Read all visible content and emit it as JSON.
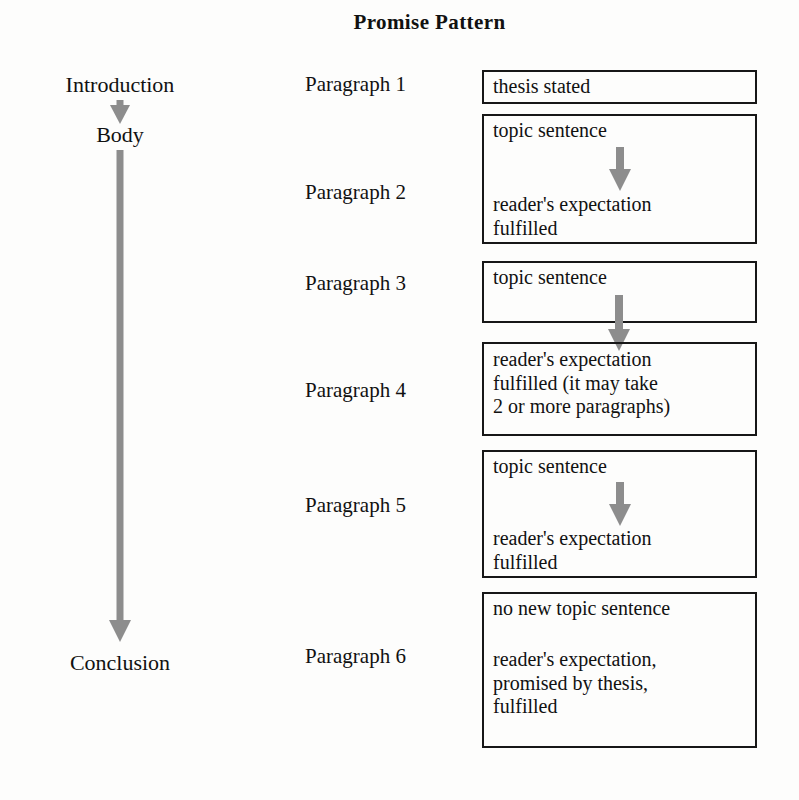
{
  "title": "Promise Pattern",
  "stages": [
    {
      "name": "introduction",
      "label": "Introduction"
    },
    {
      "name": "body",
      "label": "Body"
    },
    {
      "name": "conclusion",
      "label": "Conclusion"
    }
  ],
  "paragraph_labels": [
    "Paragraph 1",
    "Paragraph 2",
    "Paragraph 3",
    "Paragraph 4",
    "Paragraph 5",
    "Paragraph 6"
  ],
  "boxes": [
    {
      "id": "box-1",
      "lines_top": "thesis stated",
      "lines_bottom": "",
      "has_inner_arrow": false
    },
    {
      "id": "box-2",
      "lines_top": "topic sentence",
      "lines_bottom": "reader's expectation\nfulfilled",
      "has_inner_arrow": true
    },
    {
      "id": "box-3",
      "lines_top": "topic sentence",
      "lines_bottom": "",
      "has_inner_arrow": false
    },
    {
      "id": "box-4",
      "lines_top": "reader's expectation\nfulfilled (it may take\n2 or more paragraphs)",
      "lines_bottom": "",
      "has_inner_arrow": false
    },
    {
      "id": "box-5",
      "lines_top": "topic sentence",
      "lines_bottom": "reader's expectation\nfulfilled",
      "has_inner_arrow": true
    },
    {
      "id": "box-6",
      "lines_top": "no new topic sentence",
      "lines_bottom": "reader's expectation,\npromised by thesis,\nfulfilled",
      "has_inner_arrow": false
    }
  ],
  "colors": {
    "arrow_gray": "#8d8d8d",
    "box_border": "#171717",
    "text": "#111111",
    "background": "#fdfdfc"
  }
}
